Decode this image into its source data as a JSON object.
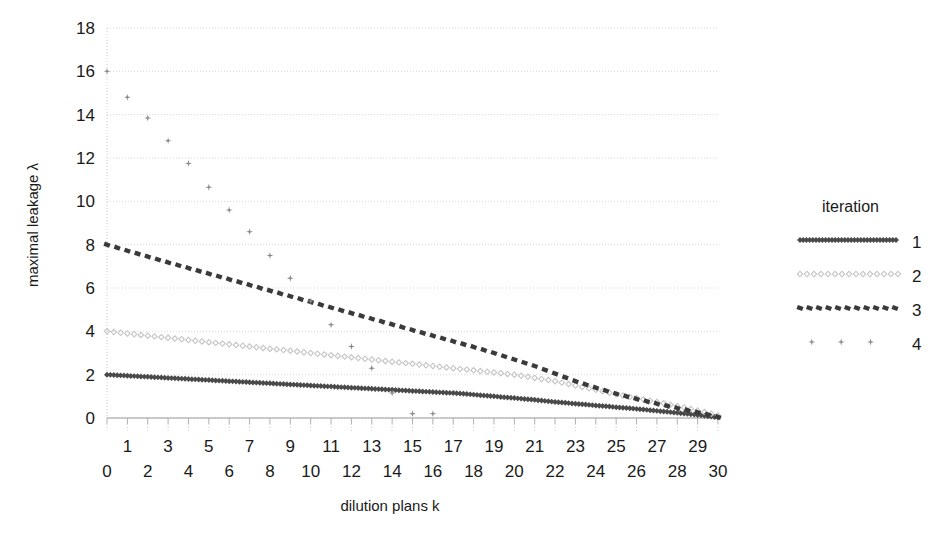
{
  "chart_data": {
    "type": "scatter",
    "title": "",
    "xlabel": "dilution plans k",
    "ylabel": "maximal leakage λ",
    "xlim": [
      0,
      30
    ],
    "ylim": [
      0,
      18
    ],
    "grid": true,
    "x_ticks_upper": [
      "1",
      "3",
      "5",
      "7",
      "9",
      "11",
      "13",
      "15",
      "17",
      "19",
      "21",
      "23",
      "25",
      "27",
      "29"
    ],
    "x_ticks_lower": [
      "0",
      "2",
      "4",
      "6",
      "8",
      "10",
      "12",
      "14",
      "16",
      "18",
      "20",
      "22",
      "24",
      "26",
      "28",
      "30"
    ],
    "x_ticks": [
      0,
      1,
      2,
      3,
      4,
      5,
      6,
      7,
      8,
      9,
      10,
      11,
      12,
      13,
      14,
      15,
      16,
      17,
      18,
      19,
      20,
      21,
      22,
      23,
      24,
      25,
      26,
      27,
      28,
      29,
      30
    ],
    "y_ticks": [
      0,
      2,
      4,
      6,
      8,
      10,
      12,
      14,
      16,
      18
    ],
    "y_tick_labels": [
      "0",
      "2",
      "4",
      "6",
      "8",
      "10",
      "12",
      "14",
      "16",
      "18"
    ],
    "legend": {
      "title": "iteration",
      "position": "right",
      "entries": [
        {
          "label": "1",
          "style": "dense-dotted-thick",
          "color": "#4a4a4a"
        },
        {
          "label": "2",
          "style": "sparse-dotted-light",
          "color": "#c4c4c4"
        },
        {
          "label": "3",
          "style": "dashed-dark",
          "color": "#3a3a3a"
        },
        {
          "label": "4",
          "style": "scatter-marker",
          "color": "#8a8a8a"
        }
      ]
    },
    "series": [
      {
        "name": "1",
        "marker": "dense-dotted-thick",
        "color": "#4a4a4a",
        "x": [
          0,
          1,
          2,
          3,
          4,
          5,
          6,
          7,
          8,
          9,
          10,
          11,
          12,
          13,
          14,
          15,
          16,
          17,
          18,
          19,
          20,
          21,
          22,
          23,
          24,
          25,
          26,
          27,
          28,
          29,
          30
        ],
        "values": [
          2.0,
          1.95,
          1.9,
          1.85,
          1.8,
          1.75,
          1.7,
          1.65,
          1.6,
          1.55,
          1.5,
          1.45,
          1.4,
          1.35,
          1.3,
          1.25,
          1.2,
          1.15,
          1.08,
          1.0,
          0.92,
          0.84,
          0.74,
          0.66,
          0.58,
          0.5,
          0.42,
          0.33,
          0.24,
          0.14,
          0.03
        ]
      },
      {
        "name": "2",
        "marker": "sparse-dotted-light",
        "color": "#c4c4c4",
        "x": [
          0,
          1,
          2,
          3,
          4,
          5,
          6,
          7,
          8,
          9,
          10,
          11,
          12,
          13,
          14,
          15,
          16,
          17,
          18,
          19,
          20,
          21,
          22,
          23,
          24,
          25,
          26,
          27,
          28,
          29,
          30
        ],
        "values": [
          4.0,
          3.9,
          3.8,
          3.7,
          3.6,
          3.5,
          3.4,
          3.3,
          3.2,
          3.1,
          3.0,
          2.9,
          2.8,
          2.7,
          2.6,
          2.5,
          2.4,
          2.3,
          2.2,
          2.1,
          2.0,
          1.85,
          1.7,
          1.5,
          1.3,
          1.1,
          0.92,
          0.74,
          0.55,
          0.35,
          0.12
        ]
      },
      {
        "name": "3",
        "marker": "dashed-dark",
        "color": "#3a3a3a",
        "x": [
          0,
          1,
          2,
          3,
          4,
          5,
          6,
          7,
          8,
          9,
          10,
          11,
          12,
          13,
          14,
          15,
          16,
          17,
          18,
          19,
          20,
          21,
          22,
          23,
          24,
          25,
          26,
          27,
          28,
          29,
          30
        ],
        "values": [
          8.0,
          7.72,
          7.45,
          7.18,
          6.92,
          6.66,
          6.4,
          6.14,
          5.88,
          5.62,
          5.36,
          5.1,
          4.84,
          4.58,
          4.32,
          4.06,
          3.8,
          3.54,
          3.28,
          3.0,
          2.7,
          2.4,
          2.05,
          1.7,
          1.4,
          1.12,
          0.88,
          0.66,
          0.46,
          0.26,
          0.05
        ]
      },
      {
        "name": "4",
        "marker": "scatter-marker",
        "color": "#8a8a8a",
        "x": [
          0,
          1,
          2,
          3,
          4,
          5,
          6,
          7,
          8,
          9,
          10,
          11,
          12,
          13,
          14,
          15,
          16
        ],
        "values": [
          16.0,
          14.8,
          13.85,
          12.8,
          11.75,
          10.65,
          9.6,
          8.6,
          7.5,
          6.45,
          5.4,
          4.3,
          3.3,
          2.3,
          1.15,
          0.2,
          0.2
        ]
      }
    ]
  }
}
